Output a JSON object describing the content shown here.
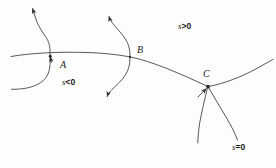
{
  "figure": {
    "background_color": "#fdfdfd",
    "stroke_color": "#3a3a3a",
    "width": 276,
    "height": 168
  },
  "points": [
    {
      "id": "A",
      "label": "A",
      "x": 60,
      "y": 66,
      "marker_x": 50,
      "marker_y": 56
    },
    {
      "id": "B",
      "label": "B",
      "x": 137,
      "y": 52,
      "marker_x": 130,
      "marker_y": 56
    },
    {
      "id": "C",
      "label": "C",
      "x": 203,
      "y": 76,
      "marker_x": 208,
      "marker_y": 87
    }
  ],
  "regions": [
    {
      "id": "s-positive",
      "var": "s",
      "op": ">",
      "value": "0",
      "text": "s>0",
      "x": 178,
      "y": 27
    },
    {
      "id": "s-negative",
      "var": "s",
      "op": "<",
      "value": "0",
      "text": "s<0",
      "x": 62,
      "y": 83
    },
    {
      "id": "s-zero",
      "var": "s",
      "op": "=",
      "value": "0",
      "text": "s=0",
      "x": 232,
      "y": 148
    }
  ],
  "curves": {
    "separatrix_label": "main curve s = 0",
    "trajectory_count": 6
  }
}
